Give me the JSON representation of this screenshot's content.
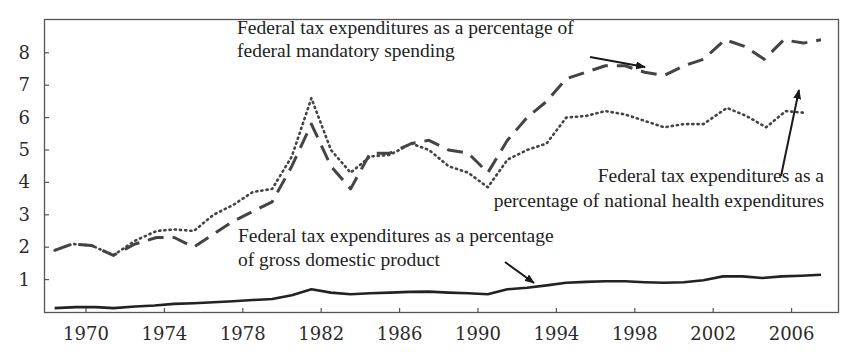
{
  "chart_data": {
    "type": "line",
    "title": "",
    "xlabel": "",
    "ylabel": "",
    "xlim": [
      1968,
      2008
    ],
    "ylim": [
      0,
      8.8
    ],
    "grid": false,
    "legend": "inline annotations with arrows",
    "x_ticks": [
      "1970",
      "1974",
      "1978",
      "1982",
      "1986",
      "1990",
      "1994",
      "1998",
      "2002",
      "2006"
    ],
    "y_ticks": [
      "1",
      "2",
      "3",
      "4",
      "5",
      "6",
      "7",
      "8"
    ],
    "series": [
      {
        "name": "Federal tax expenditures as a percentage of federal mandatory spending",
        "style": "dashed",
        "points": [
          [
            1968.4,
            1.9
          ],
          [
            1969.3,
            2.1
          ],
          [
            1970.3,
            2.05
          ],
          [
            1971.4,
            1.75
          ],
          [
            1972.5,
            2.1
          ],
          [
            1973.6,
            2.3
          ],
          [
            1974.5,
            2.3
          ],
          [
            1975.5,
            2.0
          ],
          [
            1976.5,
            2.4
          ],
          [
            1977.5,
            2.8
          ],
          [
            1978.5,
            3.1
          ],
          [
            1979.5,
            3.4
          ],
          [
            1980.5,
            4.5
          ],
          [
            1981.5,
            5.8
          ],
          [
            1982.5,
            4.5
          ],
          [
            1983.5,
            3.8
          ],
          [
            1984.5,
            4.9
          ],
          [
            1985.5,
            4.9
          ],
          [
            1986.6,
            5.2
          ],
          [
            1987.5,
            5.3
          ],
          [
            1988.5,
            5.0
          ],
          [
            1989.5,
            4.9
          ],
          [
            1990.5,
            4.3
          ],
          [
            1991.5,
            5.3
          ],
          [
            1992.5,
            6.0
          ],
          [
            1993.5,
            6.5
          ],
          [
            1994.5,
            7.2
          ],
          [
            1995.5,
            7.4
          ],
          [
            1996.5,
            7.6
          ],
          [
            1997.5,
            7.6
          ],
          [
            1998.5,
            7.4
          ],
          [
            1999.5,
            7.3
          ],
          [
            2000.5,
            7.6
          ],
          [
            2001.5,
            7.8
          ],
          [
            2002.6,
            8.4
          ],
          [
            2003.6,
            8.2
          ],
          [
            2004.6,
            7.8
          ],
          [
            2005.6,
            8.4
          ],
          [
            2006.6,
            8.3
          ],
          [
            2007.5,
            8.4
          ]
        ]
      },
      {
        "name": "Federal tax expenditures as a percentage of national health expenditures",
        "style": "dotted",
        "points": [
          [
            1968.4,
            1.9
          ],
          [
            1969.3,
            2.1
          ],
          [
            1970.3,
            2.05
          ],
          [
            1971.4,
            1.75
          ],
          [
            1972.5,
            2.2
          ],
          [
            1973.6,
            2.5
          ],
          [
            1974.5,
            2.55
          ],
          [
            1975.5,
            2.5
          ],
          [
            1976.5,
            3.0
          ],
          [
            1977.5,
            3.3
          ],
          [
            1978.5,
            3.7
          ],
          [
            1979.5,
            3.8
          ],
          [
            1980.5,
            4.8
          ],
          [
            1981.5,
            6.6
          ],
          [
            1982.5,
            5.0
          ],
          [
            1983.5,
            4.3
          ],
          [
            1984.5,
            4.8
          ],
          [
            1985.5,
            4.85
          ],
          [
            1986.6,
            5.2
          ],
          [
            1987.5,
            5.0
          ],
          [
            1988.5,
            4.5
          ],
          [
            1989.5,
            4.3
          ],
          [
            1990.5,
            3.85
          ],
          [
            1991.5,
            4.7
          ],
          [
            1992.5,
            5.0
          ],
          [
            1993.5,
            5.2
          ],
          [
            1994.5,
            6.0
          ],
          [
            1995.5,
            6.05
          ],
          [
            1996.5,
            6.2
          ],
          [
            1997.5,
            6.1
          ],
          [
            1998.5,
            5.9
          ],
          [
            1999.5,
            5.7
          ],
          [
            2000.5,
            5.8
          ],
          [
            2001.5,
            5.8
          ],
          [
            2002.7,
            6.3
          ],
          [
            2003.7,
            6.05
          ],
          [
            2004.7,
            5.7
          ],
          [
            2005.7,
            6.2
          ],
          [
            2006.6,
            6.15
          ]
        ]
      },
      {
        "name": "Federal tax expenditures as a percentage of gross domestic product",
        "style": "solid",
        "points": [
          [
            1968.4,
            0.12
          ],
          [
            1969.5,
            0.15
          ],
          [
            1970.5,
            0.15
          ],
          [
            1971.4,
            0.12
          ],
          [
            1972.5,
            0.17
          ],
          [
            1973.5,
            0.2
          ],
          [
            1974.5,
            0.25
          ],
          [
            1975.5,
            0.27
          ],
          [
            1976.5,
            0.3
          ],
          [
            1977.5,
            0.33
          ],
          [
            1978.5,
            0.37
          ],
          [
            1979.5,
            0.4
          ],
          [
            1980.5,
            0.52
          ],
          [
            1981.5,
            0.7
          ],
          [
            1982.5,
            0.6
          ],
          [
            1983.5,
            0.55
          ],
          [
            1984.5,
            0.58
          ],
          [
            1985.5,
            0.6
          ],
          [
            1986.5,
            0.62
          ],
          [
            1987.5,
            0.63
          ],
          [
            1988.5,
            0.6
          ],
          [
            1989.5,
            0.58
          ],
          [
            1990.5,
            0.55
          ],
          [
            1991.5,
            0.7
          ],
          [
            1992.5,
            0.75
          ],
          [
            1993.5,
            0.82
          ],
          [
            1994.5,
            0.9
          ],
          [
            1995.5,
            0.93
          ],
          [
            1996.5,
            0.95
          ],
          [
            1997.5,
            0.95
          ],
          [
            1998.5,
            0.92
          ],
          [
            1999.5,
            0.9
          ],
          [
            2000.5,
            0.92
          ],
          [
            2001.5,
            0.98
          ],
          [
            2002.5,
            1.1
          ],
          [
            2003.5,
            1.1
          ],
          [
            2004.5,
            1.05
          ],
          [
            2005.5,
            1.1
          ],
          [
            2006.5,
            1.12
          ],
          [
            2007.5,
            1.15
          ]
        ]
      }
    ],
    "annotations": [
      {
        "id": "mandatory",
        "lines": [
          "Federal tax expenditures as a percentage of",
          "federal mandatory spending"
        ],
        "x": 237,
        "y": [
          34,
          57
        ],
        "anchor": "start",
        "arrow": [
          590,
          57,
          645,
          67
        ]
      },
      {
        "id": "health",
        "lines": [
          "Federal tax expenditures as a",
          "percentage of national health expenditures"
        ],
        "x": 824,
        "y": [
          182,
          207
        ],
        "anchor": "end",
        "arrow": [
          781,
          176,
          799,
          90
        ]
      },
      {
        "id": "gdp",
        "lines": [
          "Federal tax expenditures as a percentage",
          "of gross domestic product"
        ],
        "x": 238,
        "y": [
          242,
          266
        ],
        "anchor": "start",
        "arrow": [
          505,
          262,
          534,
          283
        ]
      }
    ]
  }
}
